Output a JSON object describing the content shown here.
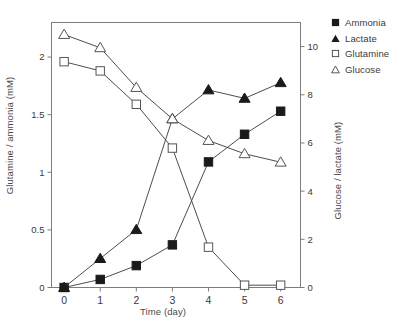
{
  "chart_data": {
    "type": "line",
    "title": "",
    "xlabel": "Time (day)",
    "ylabel": "Glutamine / ammonia (mM)",
    "ylabel_right": "Glucose / lactate (mM)",
    "x": [
      0,
      1,
      2,
      3,
      4,
      5,
      6
    ],
    "xlim": [
      -0.35,
      6.55
    ],
    "xticks": [
      "0",
      "1",
      "2",
      "3",
      "4",
      "5",
      "6"
    ],
    "ylim": [
      0,
      2.3
    ],
    "yticks": [
      "0",
      "0.5",
      "1",
      "1.5",
      "2"
    ],
    "ytickvals": [
      0,
      0.5,
      1,
      1.5,
      2
    ],
    "ylim_right": [
      0,
      11.0
    ],
    "yticks_right": [
      "0",
      "2",
      "4",
      "6",
      "8",
      "10"
    ],
    "ytickvals_right": [
      0,
      2,
      4,
      6,
      8,
      10
    ],
    "grid": false,
    "legend_position": "outside-top-right",
    "series": [
      {
        "name": "Ammonia",
        "axis": "left",
        "marker": "filled-square",
        "color": "#1a1a1a",
        "values": [
          0.0,
          0.07,
          0.19,
          0.37,
          1.09,
          1.33,
          1.53
        ]
      },
      {
        "name": "Lactate",
        "axis": "right",
        "marker": "filled-triangle",
        "color": "#1a1a1a",
        "values": [
          0.0,
          1.2,
          2.4,
          7.0,
          8.2,
          7.85,
          8.5
        ]
      },
      {
        "name": "Glutamine",
        "axis": "left",
        "marker": "open-square",
        "color": "#1a1a1a",
        "values": [
          1.96,
          1.88,
          1.59,
          1.21,
          0.35,
          0.02,
          0.02
        ]
      },
      {
        "name": "Glucose",
        "axis": "right",
        "marker": "open-triangle",
        "color": "#1a1a1a",
        "values": [
          10.5,
          9.95,
          8.3,
          7.0,
          6.1,
          5.55,
          5.2
        ]
      }
    ]
  },
  "legend": {
    "items": [
      {
        "label": "Ammonia",
        "marker": "filled-square"
      },
      {
        "label": "Lactate",
        "marker": "filled-triangle"
      },
      {
        "label": "Glutamine",
        "marker": "open-square"
      },
      {
        "label": "Glucose",
        "marker": "open-triangle"
      }
    ]
  },
  "colors": {
    "axis": "#7d7d7d",
    "ink": "#1a1a1a",
    "text": "#3a3a3a",
    "background": "#ffffff"
  }
}
